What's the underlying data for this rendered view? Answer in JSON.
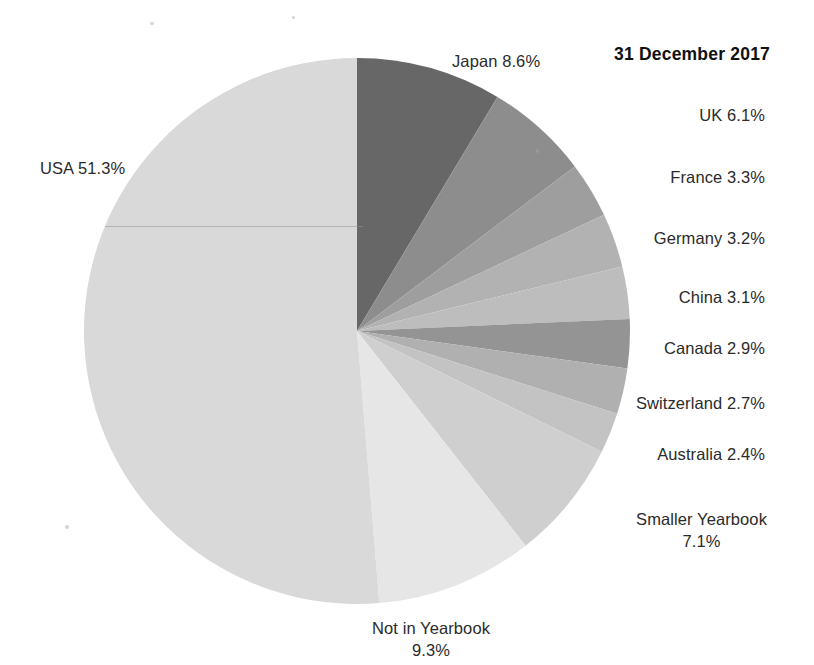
{
  "chart_data": {
    "type": "pie",
    "title": "31 December 2017",
    "xlabel": "",
    "ylabel": "",
    "units": "percent",
    "legend_position": "labels-outside",
    "grid": false,
    "start_angle_deg": 0,
    "direction": "clockwise",
    "categories": [
      "Japan",
      "UK",
      "France",
      "Germany",
      "China",
      "Canada",
      "Switzerland",
      "Australia",
      "Smaller Yearbook",
      "Not in Yearbook",
      "USA"
    ],
    "values": [
      8.6,
      6.1,
      3.3,
      3.2,
      3.1,
      2.9,
      2.7,
      2.4,
      7.1,
      9.3,
      51.3
    ],
    "slice_colors": [
      "#676767",
      "#8d8d8d",
      "#9e9e9e",
      "#b2b2b2",
      "#bdbdbd",
      "#949494",
      "#b0b0b0",
      "#c3c3c3",
      "#cfcfcf",
      "#e6e6e6",
      "#d9d9d9"
    ],
    "data_labels": [
      "Japan 8.6%",
      "UK 6.1%",
      "France 3.3%",
      "Germany 3.2%",
      "China 3.1%",
      "Canada 2.9%",
      "Switzerland 2.7%",
      "Australia 2.4%",
      "Smaller Yearbook 7.1%",
      "Not in Yearbook 9.3%",
      "USA 51.3%"
    ]
  },
  "labels": {
    "japan": "Japan 8.6%",
    "uk": "UK 6.1%",
    "france": "France 3.3%",
    "germany": "Germany 3.2%",
    "china": "China 3.1%",
    "canada": "Canada 2.9%",
    "switzerland": "Switzerland 2.7%",
    "australia": "Australia 2.4%",
    "smaller_yearbook_line1": "Smaller Yearbook",
    "smaller_yearbook_line2": "7.1%",
    "not_in_yearbook_line1": "Not in Yearbook",
    "not_in_yearbook_line2": "9.3%",
    "usa": "USA 51.3%"
  },
  "title": "31 December 2017",
  "colors": {
    "background": "#ffffff",
    "text": "#2b2b2b",
    "title_text": "#111111"
  }
}
